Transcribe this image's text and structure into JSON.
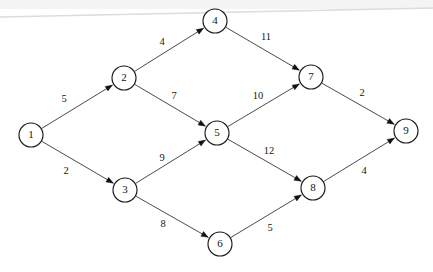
{
  "diagram": {
    "type": "directed-weighted-graph",
    "width": 433,
    "height": 272,
    "background_color": "#ffffff",
    "node_stroke_color": "#1a1a1a",
    "edge_stroke_color": "#2a2a2a",
    "text_color": "#161616",
    "node_radius": 12,
    "artifact": {
      "name": "scan-line-artifact",
      "color": "#dcdcdc",
      "x1": 0,
      "y1": 17,
      "x2": 433,
      "y2": 8
    }
  },
  "nodes": [
    {
      "id": "1",
      "label": "1",
      "x": 31,
      "y": 135
    },
    {
      "id": "2",
      "label": "2",
      "x": 124,
      "y": 78
    },
    {
      "id": "3",
      "label": "3",
      "x": 125,
      "y": 190
    },
    {
      "id": "4",
      "label": "4",
      "x": 215,
      "y": 21
    },
    {
      "id": "5",
      "label": "5",
      "x": 217,
      "y": 133
    },
    {
      "id": "6",
      "label": "6",
      "x": 220,
      "y": 244
    },
    {
      "id": "7",
      "label": "7",
      "x": 311,
      "y": 77
    },
    {
      "id": "8",
      "label": "8",
      "x": 313,
      "y": 188
    },
    {
      "id": "9",
      "label": "9",
      "x": 406,
      "y": 131
    }
  ],
  "edges": [
    {
      "id": "e1",
      "from": "1",
      "to": "2",
      "weight": "5",
      "lx": 64,
      "ly": 100
    },
    {
      "id": "e2",
      "from": "1",
      "to": "3",
      "weight": "2",
      "lx": 66,
      "ly": 172
    },
    {
      "id": "e3",
      "from": "2",
      "to": "4",
      "weight": "4",
      "lx": 162,
      "ly": 43
    },
    {
      "id": "e4",
      "from": "2",
      "to": "5",
      "weight": "7",
      "lx": 174,
      "ly": 97
    },
    {
      "id": "e5",
      "from": "3",
      "to": "5",
      "weight": "9",
      "lx": 162,
      "ly": 159
    },
    {
      "id": "e6",
      "from": "3",
      "to": "6",
      "weight": "8",
      "lx": 163,
      "ly": 225
    },
    {
      "id": "e7",
      "from": "4",
      "to": "7",
      "weight": "11",
      "lx": 266,
      "ly": 38
    },
    {
      "id": "e8",
      "from": "5",
      "to": "7",
      "weight": "10",
      "lx": 258,
      "ly": 97
    },
    {
      "id": "e9",
      "from": "5",
      "to": "8",
      "weight": "12",
      "lx": 269,
      "ly": 152
    },
    {
      "id": "e10",
      "from": "6",
      "to": "8",
      "weight": "5",
      "lx": 270,
      "ly": 229
    },
    {
      "id": "e11",
      "from": "7",
      "to": "9",
      "weight": "2",
      "lx": 362,
      "ly": 94
    },
    {
      "id": "e12",
      "from": "8",
      "to": "9",
      "weight": "4",
      "lx": 364,
      "ly": 172
    }
  ]
}
